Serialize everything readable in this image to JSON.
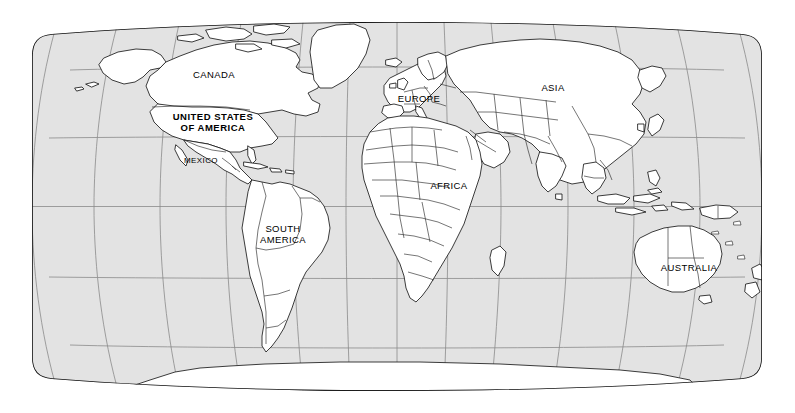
{
  "map": {
    "title": "World Map",
    "projection": "Robinson",
    "colors": {
      "ocean": "#e3e3e3",
      "land": "#ffffff",
      "coastline": "#1a1a1a",
      "country_border": "#2b2b2b",
      "graticule": "#8a8a8a",
      "frame": "#111111",
      "background": "#ffffff",
      "label_text": "#000000"
    },
    "frame": {
      "left": 32,
      "right": 762,
      "top": 22,
      "bottom": 391,
      "center_x": 397,
      "center_y": 206.5
    },
    "graticule": {
      "visible": true,
      "parallel_interval_degrees": 30,
      "meridian_interval_degrees": 30,
      "parallels": [
        60,
        30,
        0,
        -30,
        -60
      ],
      "meridians": [
        -180,
        -150,
        -120,
        -90,
        -60,
        -30,
        0,
        30,
        60,
        90,
        120,
        150,
        180
      ],
      "equator_y": 206.5
    },
    "labels": [
      {
        "id": "canada",
        "text": "CANADA",
        "x": 214,
        "y": 75,
        "size": 9.5,
        "bold": false
      },
      {
        "id": "united-states",
        "text": "UNITED STATES\nOF AMERICA",
        "x": 213,
        "y": 123,
        "size": 9.5,
        "bold": true
      },
      {
        "id": "mexico",
        "text": "MEXICO",
        "x": 201,
        "y": 161,
        "size": 8.0,
        "bold": false
      },
      {
        "id": "south-america",
        "text": "SOUTH\nAMERICA",
        "x": 283,
        "y": 235,
        "size": 9.5,
        "bold": false
      },
      {
        "id": "europe",
        "text": "EUROPE",
        "x": 419,
        "y": 99,
        "size": 9.5,
        "bold": false
      },
      {
        "id": "africa",
        "text": "AFRICA",
        "x": 449,
        "y": 186,
        "size": 9.5,
        "bold": false
      },
      {
        "id": "asia",
        "text": "ASIA",
        "x": 553,
        "y": 88,
        "size": 9.5,
        "bold": false
      },
      {
        "id": "australia",
        "text": "AUSTRALIA",
        "x": 689,
        "y": 268,
        "size": 9.5,
        "bold": false
      }
    ],
    "continents": [
      "North America",
      "South America",
      "Europe",
      "Africa",
      "Asia",
      "Australia",
      "Antarctica",
      "Greenland"
    ]
  }
}
